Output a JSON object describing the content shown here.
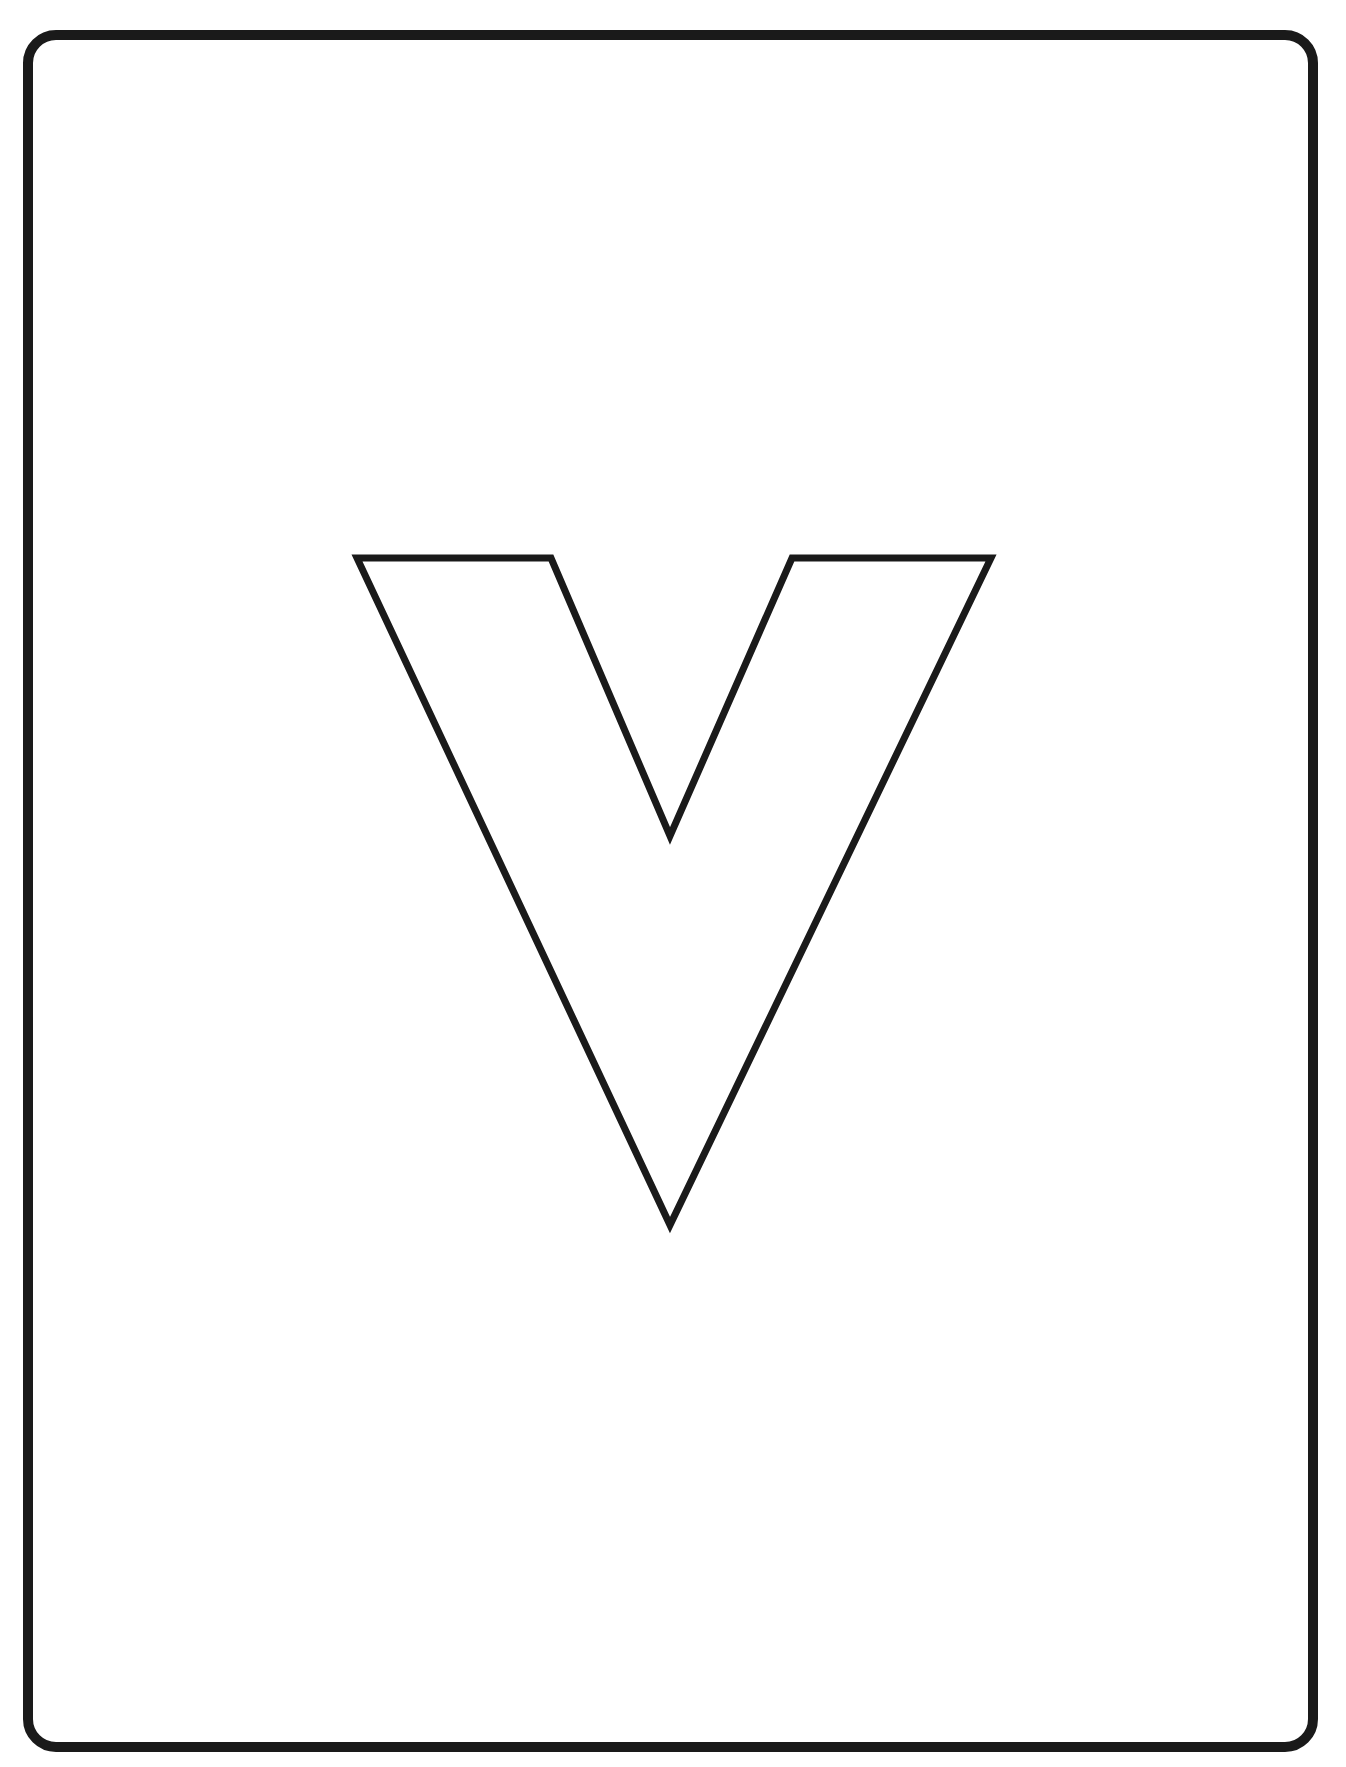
{
  "page": {
    "kind": "coloring-page",
    "letter": "V",
    "colors": {
      "background": "#ffffff",
      "stroke": "#1a1a1a"
    }
  }
}
